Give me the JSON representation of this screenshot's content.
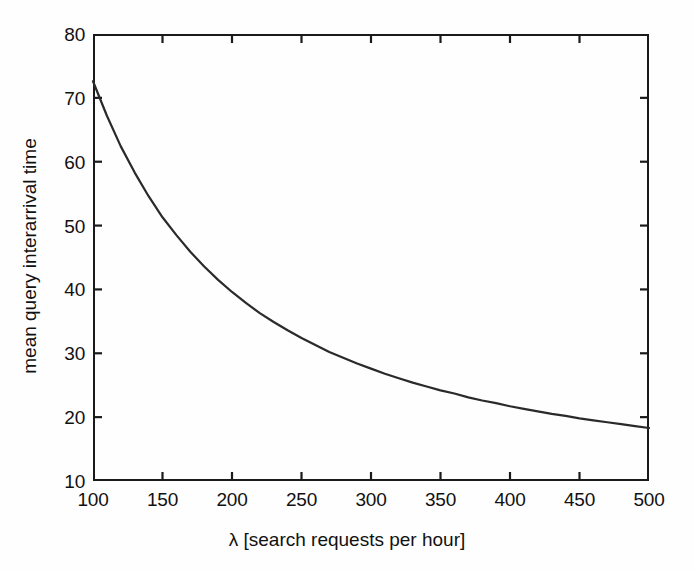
{
  "figure": {
    "background_color": "#fefefe",
    "axis_color": "#1a1a1a",
    "line_color": "#2a2a2a"
  },
  "chart_data": {
    "type": "line",
    "title": "",
    "xlabel": "λ [search requests per hour]",
    "ylabel": "mean query interarrival time",
    "xlim": [
      100,
      500
    ],
    "ylim": [
      10,
      80
    ],
    "xticks": [
      100,
      150,
      200,
      250,
      300,
      350,
      400,
      450,
      500
    ],
    "xticklabels": [
      "100",
      "150",
      "200",
      "250",
      "300",
      "350",
      "400",
      "450",
      "500"
    ],
    "yticks": [
      10,
      20,
      30,
      40,
      50,
      60,
      70,
      80
    ],
    "yticklabels": [
      "10",
      "20",
      "30",
      "40",
      "50",
      "60",
      "70",
      "80"
    ],
    "grid": false,
    "legend": null,
    "legend_position": "none",
    "tick_direction": "in",
    "box": true,
    "series": [
      {
        "name": "mean query interarrival time",
        "color": "#2a2a2a",
        "linewidth": 2.2,
        "x": [
          100,
          110,
          120,
          130,
          140,
          150,
          160,
          170,
          180,
          190,
          200,
          210,
          220,
          230,
          240,
          250,
          260,
          270,
          280,
          290,
          300,
          310,
          320,
          330,
          340,
          350,
          360,
          370,
          380,
          390,
          400,
          410,
          420,
          430,
          440,
          450,
          460,
          470,
          480,
          490,
          500
        ],
        "y": [
          72.6,
          67.2,
          62.4,
          58.3,
          54.6,
          51.3,
          48.5,
          45.9,
          43.6,
          41.5,
          39.6,
          37.9,
          36.3,
          34.9,
          33.6,
          32.4,
          31.3,
          30.2,
          29.3,
          28.4,
          27.6,
          26.8,
          26.1,
          25.4,
          24.8,
          24.2,
          23.7,
          23.1,
          22.6,
          22.2,
          21.7,
          21.3,
          20.9,
          20.5,
          20.2,
          19.8,
          19.5,
          19.2,
          18.9,
          18.6,
          18.3
        ]
      }
    ],
    "annotations": []
  }
}
